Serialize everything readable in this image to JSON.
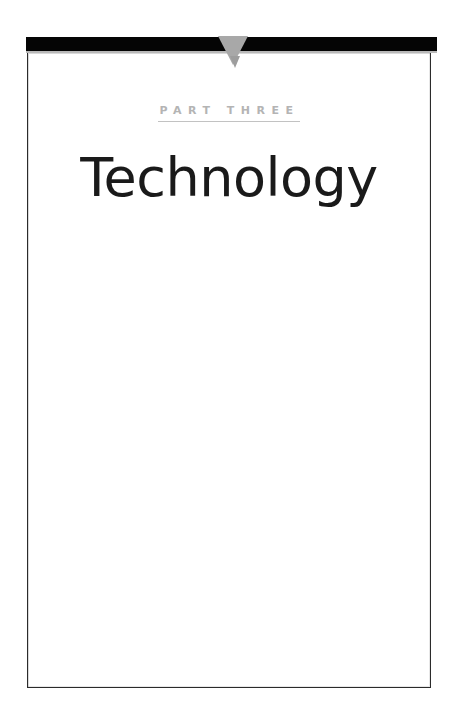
{
  "document": {
    "kind": "book-part-divider-page",
    "background_color": "#ffffff"
  },
  "header": {
    "band_color": "#050505",
    "rule_color": "#b9b9b9",
    "marker_icon": "triangle-down-icon",
    "marker_color": "#a8a8a8"
  },
  "page": {
    "border_color": "#2b2b2b",
    "part_label": "PART THREE",
    "part_label_color": "#b4b4b4",
    "part_label_rule_color": "#c2c2c2",
    "title": "Technology",
    "title_color": "#1a1a1a"
  }
}
